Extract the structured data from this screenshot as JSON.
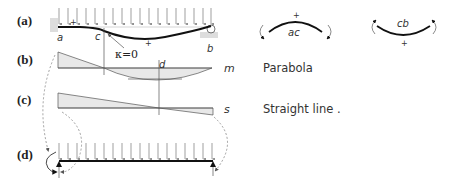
{
  "panels": [
    {
      "id": "a",
      "label": "(a)"
    },
    {
      "id": "b",
      "label": "(b)"
    },
    {
      "id": "c",
      "label": "(c)"
    },
    {
      "id": "d",
      "label": "(d)"
    }
  ],
  "beam_a": {
    "point_labels": {
      "a": "a",
      "c": "c",
      "b": "b"
    },
    "inflection_label": "κ=0",
    "sign_left": "+",
    "sign_right": "+"
  },
  "diagram_b": {
    "point_label": "d",
    "curve_label": "m",
    "description": "Parabola"
  },
  "diagram_c": {
    "curve_label": "s",
    "description": "Straight line ."
  },
  "curvature_legend": [
    {
      "label": "ac",
      "sign": "+"
    },
    {
      "label": "cb",
      "sign": "+"
    }
  ],
  "colors": {
    "fill": "#e8e8e8",
    "stroke": "#555555",
    "beam": "#111111",
    "support": "#cccccc"
  }
}
